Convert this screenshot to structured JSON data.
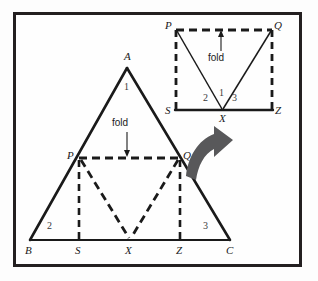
{
  "figure": {
    "caption_none": "",
    "frame_color": "#231f20",
    "background_color": "#fefefe",
    "solid_stroke_color": "#1a1a1a",
    "dashed_stroke_color": "#1a1a1a",
    "arrow_fill_color": "#58585a"
  },
  "main_triangle": {
    "vertex_labels": {
      "apex": "A",
      "bottom_left": "B",
      "bottom_right": "C",
      "left_fold": "P",
      "right_fold": "Q",
      "base_left": "S",
      "base_mid": "X",
      "base_right": "Z"
    },
    "region_numbers": {
      "apex_region": "1",
      "left_region": "2",
      "right_region": "3"
    },
    "fold_annotation": {
      "label": "fold",
      "arrow_direction": "down",
      "arrow_icon": "down-arrow-icon"
    }
  },
  "folded_square": {
    "vertex_labels": {
      "top_left": "P",
      "top_right": "Q",
      "bottom_left": "S",
      "bottom_mid": "X",
      "bottom_right": "Z"
    },
    "region_numbers": {
      "center_region": "1",
      "left_region": "2",
      "right_region": "3"
    },
    "fold_annotation": {
      "label": "fold",
      "arrow_direction": "up",
      "arrow_icon": "up-arrow-icon"
    }
  },
  "transform_arrow": {
    "icon": "curved-arrow-icon",
    "direction": "up-right",
    "description_none": ""
  }
}
